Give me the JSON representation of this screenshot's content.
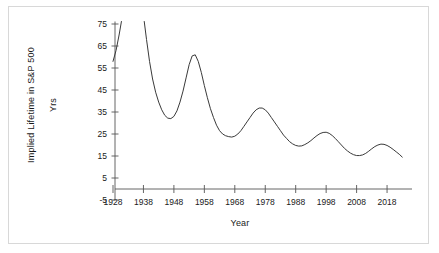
{
  "chart_data": {
    "type": "line",
    "title": "",
    "xlabel": "Year",
    "ylabel": "Implied Lifetime in S&P 500",
    "ylabel_line2": "Yrs",
    "xlim": [
      1926,
      2025
    ],
    "ylim": [
      -5,
      80
    ],
    "grid": false,
    "legend": false,
    "xticks": [
      1928,
      1938,
      1948,
      1958,
      1968,
      1978,
      1988,
      1998,
      2008,
      2018
    ],
    "yticks": [
      -5,
      5,
      15,
      25,
      35,
      45,
      55,
      65,
      75
    ],
    "series": [
      {
        "name": "Implied Lifetime in S&P 500",
        "note": "Line is clipped at the top of the axis; values above 75 run off-chart between roughly 1931 and 1938.",
        "x": [
          1928,
          1929,
          1930,
          1931,
          1938,
          1939,
          1940,
          1941,
          1942,
          1943,
          1944,
          1945,
          1946,
          1947,
          1948,
          1949,
          1950,
          1951,
          1952,
          1953,
          1954,
          1955,
          1956,
          1957,
          1958,
          1959,
          1960,
          1961,
          1962,
          1963,
          1964,
          1965,
          1966,
          1967,
          1968,
          1969,
          1970,
          1971,
          1972,
          1973,
          1974,
          1975,
          1976,
          1977,
          1978,
          1979,
          1980,
          1981,
          1982,
          1983,
          1984,
          1985,
          1986,
          1987,
          1988,
          1989,
          1990,
          1991,
          1992,
          1993,
          1994,
          1995,
          1996,
          1997,
          1998,
          1999,
          2000,
          2001,
          2002,
          2003,
          2004,
          2005,
          2006,
          2007,
          2008,
          2009,
          2010,
          2011,
          2012,
          2013,
          2014,
          2015,
          2016,
          2017,
          2018,
          2019,
          2020,
          2021,
          2022,
          2023
        ],
        "y": [
          58.0,
          63.0,
          70.0,
          78.0,
          79.0,
          68.0,
          58.0,
          50.0,
          44.0,
          39.5,
          36.0,
          33.5,
          32.2,
          32.0,
          33.0,
          35.5,
          39.5,
          44.5,
          50.5,
          56.5,
          60.5,
          61.0,
          58.0,
          53.0,
          47.0,
          41.5,
          36.5,
          32.5,
          29.0,
          26.5,
          25.0,
          24.2,
          23.8,
          23.6,
          24.0,
          25.0,
          26.5,
          28.5,
          30.5,
          32.5,
          34.5,
          36.0,
          36.8,
          36.8,
          36.0,
          34.5,
          32.5,
          30.5,
          28.5,
          26.5,
          24.5,
          23.0,
          21.5,
          20.5,
          19.8,
          19.5,
          19.6,
          20.2,
          21.0,
          22.0,
          23.2,
          24.3,
          25.2,
          25.7,
          25.8,
          25.3,
          24.3,
          23.0,
          21.5,
          20.0,
          18.5,
          17.3,
          16.3,
          15.6,
          15.2,
          15.2,
          15.5,
          16.2,
          17.2,
          18.3,
          19.3,
          20.0,
          20.4,
          20.3,
          19.8,
          19.0,
          18.0,
          16.9,
          15.8,
          14.5
        ]
      }
    ]
  },
  "axis": {
    "y_title_line1": "Implied Lifetime in S&P 500",
    "y_title_line2": "Yrs",
    "x_title": "Year"
  }
}
